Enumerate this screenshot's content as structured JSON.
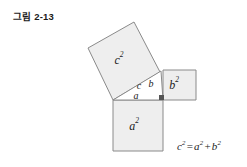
{
  "figure": {
    "title": "그림 2-13",
    "caption_formula": {
      "lhs_base": "c",
      "lhs_exp": "2",
      "equals": "=",
      "term1_base": "a",
      "term1_exp": "2",
      "plus": "+",
      "term2_base": "b",
      "term2_exp": "2",
      "full_text": "c² = a² + b²"
    }
  },
  "diagram": {
    "type": "pythagorean-theorem",
    "squares": [
      {
        "id": "square-c",
        "label_base": "c",
        "label_exp": "2",
        "label_text": "c²",
        "orientation": "tilted",
        "fill": "#eeeeee",
        "stroke": "#8a8a8a",
        "points": "113,100 88,48 134,22 160,72",
        "label_x": 119,
        "label_y": 64
      },
      {
        "id": "square-b",
        "label_base": "b",
        "label_exp": "2",
        "label_text": "b²",
        "orientation": "axis-aligned",
        "fill": "#eeeeee",
        "stroke": "#8a8a8a",
        "points": "163,70 196,70 196,100 163,100",
        "label_x": 174,
        "label_y": 89
      },
      {
        "id": "square-a",
        "label_base": "a",
        "label_exp": "2",
        "label_text": "a²",
        "orientation": "axis-aligned",
        "fill": "#eeeeee",
        "stroke": "#8a8a8a",
        "points": "113,100 163,100 163,151 113,151",
        "label_x": 134,
        "label_y": 130
      }
    ],
    "triangle": {
      "id": "right-triangle",
      "points": "113,100 163,100 161,71",
      "fill": "#ffffff",
      "stroke": "#8a8a8a",
      "side_labels": [
        {
          "name": "hypotenuse",
          "text": "c",
          "x": 139,
          "y": 89
        },
        {
          "name": "vertical-leg",
          "text": "b",
          "x": 151,
          "y": 87
        },
        {
          "name": "horizontal-leg",
          "text": "a",
          "x": 136,
          "y": 98
        }
      ],
      "right_angle_marker": {
        "x": 159,
        "y": 95,
        "width": 5,
        "height": 5,
        "fill": "#555555"
      }
    }
  }
}
